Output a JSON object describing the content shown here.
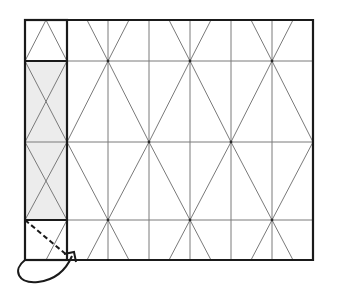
{
  "diagram": {
    "title": "",
    "grid": {
      "left": 25,
      "top": 20,
      "right": 313,
      "bottom": 260,
      "strip_right": 67,
      "column_x": [
        67,
        108,
        149,
        190,
        231,
        272,
        313
      ],
      "row_y": [
        20,
        61,
        142,
        220,
        260
      ],
      "node_points": [
        [
          108,
          61
        ],
        [
          190,
          61
        ],
        [
          272,
          61
        ],
        [
          67,
          142
        ],
        [
          149,
          142
        ],
        [
          231,
          142
        ],
        [
          313,
          142
        ],
        [
          108,
          220
        ],
        [
          190,
          220
        ],
        [
          272,
          220
        ]
      ]
    },
    "strip": {
      "shaded_panel": "middle",
      "shade_color": "#ececec"
    },
    "colors": {
      "thin_line": "#7a7a7a",
      "thick_line": "#1a1a1a",
      "background": "#ffffff"
    },
    "annotations": {
      "fold_arrow": "curved arrow from bottom-left corner looping to the strip bottom-right",
      "dashed_line": "diagonal dashed fold line in bottom strip cell"
    }
  }
}
